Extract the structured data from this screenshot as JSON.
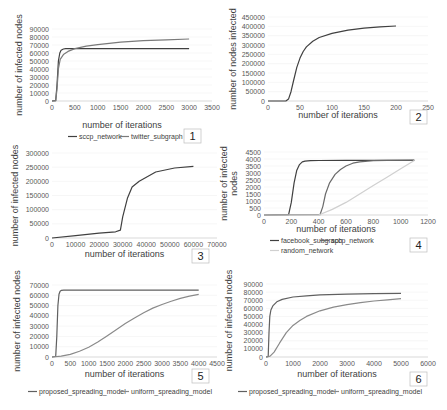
{
  "colors": {
    "dark": "#404040",
    "mid": "#7a7a7a",
    "light": "#d0d0d0"
  },
  "chart_data": [
    {
      "id": 1,
      "type": "line",
      "panel_label": "1",
      "xlabel": "number of iterations",
      "ylabel": "number of infected nodes",
      "xlim": [
        0,
        3500
      ],
      "ylim": [
        0,
        90000
      ],
      "xticks": [
        "0",
        "500",
        "1000",
        "1500",
        "2000",
        "2500",
        "3000",
        "3500"
      ],
      "yticks": [
        "0",
        "10000",
        "20000",
        "30000",
        "40000",
        "50000",
        "60000",
        "70000",
        "80000",
        "90000"
      ],
      "legend": [
        "sccp_network",
        "twitter_subgraph"
      ],
      "series": [
        {
          "name": "sccp_network",
          "color": "#404040",
          "x": [
            0,
            80,
            110,
            140,
            170,
            200,
            250,
            300,
            500,
            1000,
            2000,
            3000
          ],
          "y": [
            0,
            500,
            20000,
            50000,
            60000,
            63500,
            65000,
            65500,
            65500,
            65500,
            65500,
            65500
          ]
        },
        {
          "name": "twitter_subgraph",
          "color": "#7a7a7a",
          "x": [
            0,
            80,
            110,
            140,
            180,
            250,
            350,
            500,
            750,
            1000,
            1500,
            2000,
            2500,
            3000
          ],
          "y": [
            0,
            500,
            15000,
            40000,
            52000,
            58000,
            62000,
            65500,
            68500,
            70500,
            73500,
            75500,
            76500,
            77500
          ]
        }
      ]
    },
    {
      "id": 2,
      "type": "line",
      "panel_label": "2",
      "xlabel": "number of iterations",
      "ylabel": "number of nodes infected",
      "xlim": [
        0,
        250
      ],
      "ylim": [
        0,
        450000
      ],
      "xticks": [
        "0",
        "50",
        "100",
        "150",
        "200",
        "250"
      ],
      "yticks": [
        "0",
        "50000",
        "100000",
        "150000",
        "200000",
        "250000",
        "300000",
        "350000",
        "400000",
        "450000"
      ],
      "legend": [],
      "series": [
        {
          "name": "series",
          "color": "#404040",
          "x": [
            0,
            28,
            32,
            36,
            40,
            45,
            50,
            55,
            60,
            70,
            80,
            100,
            125,
            150,
            175,
            200
          ],
          "y": [
            0,
            0,
            10000,
            50000,
            110000,
            180000,
            230000,
            265000,
            290000,
            320000,
            340000,
            362000,
            380000,
            390000,
            397000,
            402000
          ]
        }
      ]
    },
    {
      "id": 3,
      "type": "line",
      "panel_label": "3",
      "xlabel": "number of iterations",
      "ylabel": "number of infected nodes",
      "xlim": [
        0,
        70000
      ],
      "ylim": [
        0,
        300000
      ],
      "xticks": [
        "0",
        "10000",
        "20000",
        "30000",
        "40000",
        "50000",
        "60000",
        "70000"
      ],
      "yticks": [
        "0",
        "50000",
        "100000",
        "150000",
        "200000",
        "250000",
        "300000"
      ],
      "legend": [],
      "series": [
        {
          "name": "series",
          "color": "#404040",
          "x": [
            0,
            10000,
            20000,
            27000,
            29000,
            30000,
            32000,
            34000,
            37000,
            44000,
            52000,
            60000
          ],
          "y": [
            0,
            8000,
            17000,
            22000,
            28000,
            75000,
            140000,
            180000,
            200000,
            233000,
            247000,
            253000
          ]
        }
      ]
    },
    {
      "id": 4,
      "type": "line",
      "panel_label": "4",
      "xlabel": "number of iterations",
      "ylabel": "number of infected nodes",
      "xlim": [
        0,
        1200
      ],
      "ylim": [
        0,
        4500
      ],
      "xticks": [
        "0",
        "200",
        "400",
        "600",
        "800",
        "1000",
        "1200"
      ],
      "yticks": [
        "0",
        "500",
        "1000",
        "1500",
        "2000",
        "2500",
        "3000",
        "3500",
        "4000",
        "4500"
      ],
      "legend": [
        "facebook_subgraph",
        "sccp_network",
        "random_network"
      ],
      "series": [
        {
          "name": "facebook_subgraph",
          "color": "#404040",
          "x": [
            0,
            180,
            200,
            220,
            240,
            260,
            280,
            300,
            340,
            400,
            600,
            800,
            1100
          ],
          "y": [
            0,
            20,
            900,
            2300,
            3200,
            3600,
            3800,
            3850,
            3880,
            3890,
            3900,
            3900,
            3900
          ]
        },
        {
          "name": "sccp_network",
          "color": "#6a6a6a",
          "x": [
            0,
            410,
            430,
            450,
            480,
            520,
            560,
            600,
            650,
            700,
            800,
            900,
            1100
          ],
          "y": [
            0,
            20,
            600,
            1500,
            2300,
            2900,
            3250,
            3500,
            3700,
            3800,
            3880,
            3900,
            3920
          ]
        },
        {
          "name": "random_network",
          "color": "#d0d0d0",
          "x": [
            0,
            400,
            500,
            600,
            700,
            800,
            900,
            1000,
            1100
          ],
          "y": [
            0,
            0,
            400,
            900,
            1500,
            2100,
            2700,
            3300,
            3900
          ]
        }
      ]
    },
    {
      "id": 5,
      "type": "line",
      "panel_label": "5",
      "xlabel": "number of iterations",
      "ylabel": "number of infected nodes",
      "xlim": [
        0,
        4500
      ],
      "ylim": [
        0,
        70000
      ],
      "xticks": [
        "0",
        "500",
        "1000",
        "1500",
        "2000",
        "2500",
        "3000",
        "3500",
        "4000",
        "4500"
      ],
      "yticks": [
        "0",
        "10000",
        "20000",
        "30000",
        "40000",
        "50000",
        "60000",
        "70000"
      ],
      "legend": [
        "proposed_spreading_model",
        "uniform_spreading_model"
      ],
      "series": [
        {
          "name": "proposed_spreading_model",
          "color": "#606060",
          "x": [
            0,
            100,
            130,
            160,
            190,
            220,
            260,
            320,
            500,
            1000,
            2000,
            3000,
            4000
          ],
          "y": [
            0,
            500,
            20000,
            50000,
            61000,
            64000,
            64800,
            65000,
            65000,
            65000,
            65000,
            65000,
            65000
          ]
        },
        {
          "name": "uniform_spreading_model",
          "color": "#8a8a8a",
          "x": [
            0,
            250,
            500,
            750,
            1000,
            1250,
            1500,
            1750,
            2000,
            2250,
            2500,
            2750,
            3000,
            3250,
            3500,
            3750,
            4000
          ],
          "y": [
            0,
            800,
            2500,
            5500,
            9500,
            14500,
            20500,
            26500,
            32500,
            38000,
            43000,
            47500,
            51000,
            54200,
            57000,
            59200,
            61000
          ]
        }
      ]
    },
    {
      "id": 6,
      "type": "line",
      "panel_label": "6",
      "xlabel": "number of iterations",
      "ylabel": "number of infected nodes",
      "xlim": [
        0,
        6000
      ],
      "ylim": [
        0,
        90000
      ],
      "xticks": [
        "0",
        "1000",
        "2000",
        "3000",
        "4000",
        "5000",
        "6000"
      ],
      "yticks": [
        "0",
        "10000",
        "20000",
        "30000",
        "40000",
        "50000",
        "60000",
        "70000",
        "80000",
        "90000"
      ],
      "legend": [
        "proposed_spreading_model",
        "uniform_spreading_model"
      ],
      "series": [
        {
          "name": "proposed_spreading_model",
          "color": "#606060",
          "x": [
            0,
            80,
            110,
            140,
            180,
            250,
            400,
            600,
            1000,
            1500,
            2000,
            3000,
            4000,
            5000
          ],
          "y": [
            0,
            500,
            30000,
            50000,
            58000,
            63000,
            68000,
            71000,
            74000,
            75500,
            76500,
            77500,
            78000,
            78500
          ]
        },
        {
          "name": "uniform_spreading_model",
          "color": "#8a8a8a",
          "x": [
            0,
            150,
            300,
            500,
            750,
            1000,
            1250,
            1500,
            2000,
            2500,
            3000,
            3500,
            4000,
            4500,
            5000
          ],
          "y": [
            0,
            1000,
            6000,
            17000,
            30000,
            39000,
            45000,
            50000,
            57000,
            61500,
            64500,
            67000,
            69000,
            70500,
            72000
          ]
        }
      ]
    }
  ]
}
